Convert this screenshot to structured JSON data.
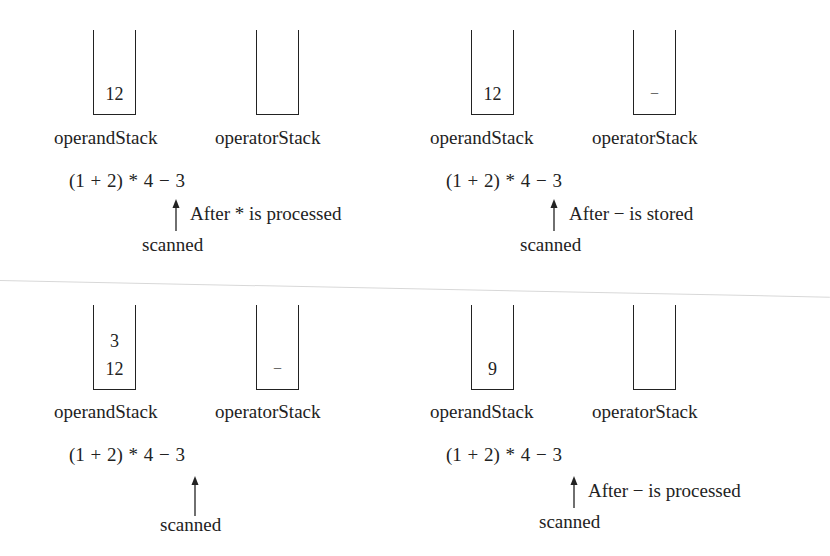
{
  "figure": {
    "expression": "(1 + 2) * 4 − 3",
    "panels": [
      {
        "id": "top-left",
        "operand_stack": {
          "label": "operandStack",
          "items": [
            "12"
          ]
        },
        "operator_stack": {
          "label": "operatorStack",
          "items": []
        },
        "expression": "(1 + 2) * 4 − 3",
        "pointer_label": "scanned",
        "note": "After * is processed"
      },
      {
        "id": "top-right",
        "operand_stack": {
          "label": "operandStack",
          "items": [
            "12"
          ]
        },
        "operator_stack": {
          "label": "operatorStack",
          "items": [
            "−"
          ]
        },
        "expression": "(1 + 2) * 4 − 3",
        "pointer_label": "scanned",
        "note": "After − is stored"
      },
      {
        "id": "bottom-left",
        "operand_stack": {
          "label": "operandStack",
          "items": [
            "3",
            "12"
          ]
        },
        "operator_stack": {
          "label": "operatorStack",
          "items": [
            "−"
          ]
        },
        "expression": "(1 + 2) * 4 − 3",
        "pointer_label": "scanned",
        "note": ""
      },
      {
        "id": "bottom-right",
        "operand_stack": {
          "label": "operandStack",
          "items": [
            "9"
          ]
        },
        "operator_stack": {
          "label": "operatorStack",
          "items": []
        },
        "expression": "(1 + 2) * 4 − 3",
        "pointer_label": "scanned",
        "note": "After − is processed"
      }
    ]
  },
  "icons": {
    "pointer": "up-arrow-icon"
  },
  "colors": {
    "ink": "#222222",
    "background": "#ffffff",
    "artifact_line": "#d8d8d8"
  }
}
